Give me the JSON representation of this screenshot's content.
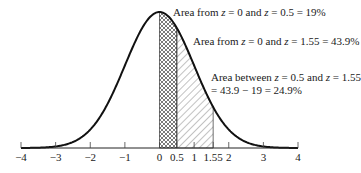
{
  "chart_data": {
    "type": "area",
    "title": "",
    "xlabel": "",
    "ylabel": "",
    "xlim": [
      -4,
      4
    ],
    "x_ticks": [
      -4,
      -3,
      -2,
      -1,
      0,
      0.5,
      1,
      1.55,
      2,
      3,
      4
    ],
    "x_tick_labels": [
      "−4",
      "−3",
      "−2",
      "−1",
      "0",
      "0.5",
      "1",
      "1.55",
      "2",
      "3",
      "4"
    ],
    "grid": false,
    "curve": "standard normal pdf",
    "shaded_regions": [
      {
        "from": 0,
        "to": 0.5,
        "pattern": "crosshatch",
        "area_percent": 19
      },
      {
        "from": 0.5,
        "to": 1.55,
        "pattern": "diagonal-hatch",
        "area_percent": 24.9
      }
    ],
    "annotations": [
      {
        "text": "Area from z = 0 and z = 0.5 = 19%",
        "value": 19
      },
      {
        "text": "Area from z = 0 and z = 1.55 = 43.9%",
        "value": 43.9
      },
      {
        "text": "Area between z = 0.5 and z = 1.55 = 43.9 − 19 = 24.9%",
        "value": 24.9
      }
    ]
  },
  "annotations": {
    "a1": {
      "prefix": "Area from ",
      "z1": "z",
      "mid1": " = 0 and ",
      "z2": "z",
      "mid2": " = 0.5 = 19%"
    },
    "a2": {
      "prefix": "Area from ",
      "z1": "z",
      "mid1": " = 0 and ",
      "z2": "z",
      "mid2": " = 1.55 = 43.9%"
    },
    "a3": {
      "prefix": "Area between ",
      "z1": "z",
      "mid1": " = 0.5 and ",
      "z2": "z",
      "mid2": " = 1.55",
      "line2": "= 43.9 − 19 = 24.9%"
    }
  },
  "ticks": [
    "−4",
    "−3",
    "−2",
    "−1",
    "0",
    "0.5",
    "1",
    "1.55",
    "2",
    "3",
    "4"
  ]
}
